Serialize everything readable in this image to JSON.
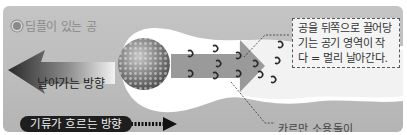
{
  "diagram": {
    "title": "딤플이 있는 공",
    "callout_text": "공을 뒤쪽으로 끌어당기는 공기 영역이 작다 = 멀리 날아간다.",
    "fly_direction_label": "날아가는 방향",
    "airflow_direction_label": "기류가 흐르는 방향",
    "karman_vortex_label": "카르만 소용돌이",
    "colors": {
      "panel_bg": "#bfbfbf",
      "airflow_band": "#ffffff",
      "wake_arrow": "#9a9a9a",
      "flow_label_bg": "#1e1e1e",
      "ball": "#7a7a7a"
    }
  }
}
